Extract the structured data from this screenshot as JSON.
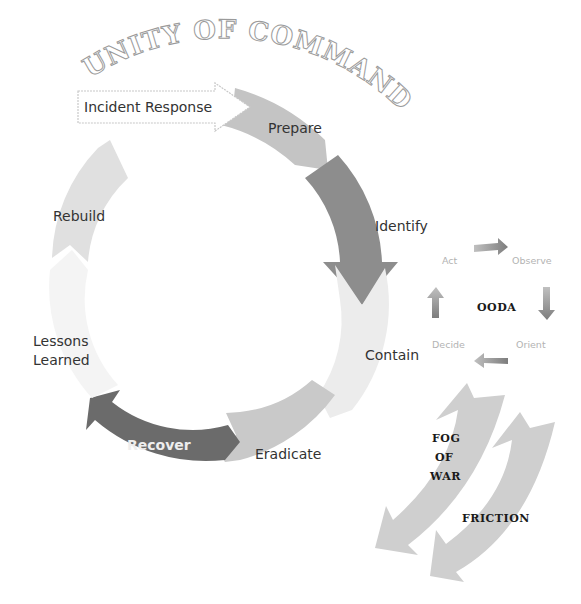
{
  "title_arc": "UNITY OF COMMAND",
  "incident_response": {
    "label": "Incident Response"
  },
  "cycle": {
    "name": "incident-response-cycle",
    "steps": [
      {
        "label": "Prepare",
        "color": "#c4c4c4"
      },
      {
        "label": "Identify",
        "color": "#8d8d8d"
      },
      {
        "label": "Contain",
        "color": "#ececec"
      },
      {
        "label": "Eradicate",
        "color": "#c9c9c9"
      },
      {
        "label": "Recover",
        "color": "#6b6b6b"
      },
      {
        "label": "Lessons Learned",
        "label_line1": "Lessons",
        "label_line2": "Learned",
        "color": "#f4f4f4"
      },
      {
        "label": "Rebuild",
        "color": "#e0e0e0"
      }
    ]
  },
  "ooda": {
    "center_label": "OODA",
    "steps": [
      {
        "label": "Observe"
      },
      {
        "label": "Orient"
      },
      {
        "label": "Decide"
      },
      {
        "label": "Act"
      }
    ],
    "arrow_color": "#9a9a9a"
  },
  "side_arrows": [
    {
      "label": "FOG OF WAR",
      "line1": "FOG",
      "line2": "OF",
      "line3": "WAR",
      "color": "#cfcfcf"
    },
    {
      "label": "FRICTION",
      "color": "#cfcfcf"
    }
  ]
}
